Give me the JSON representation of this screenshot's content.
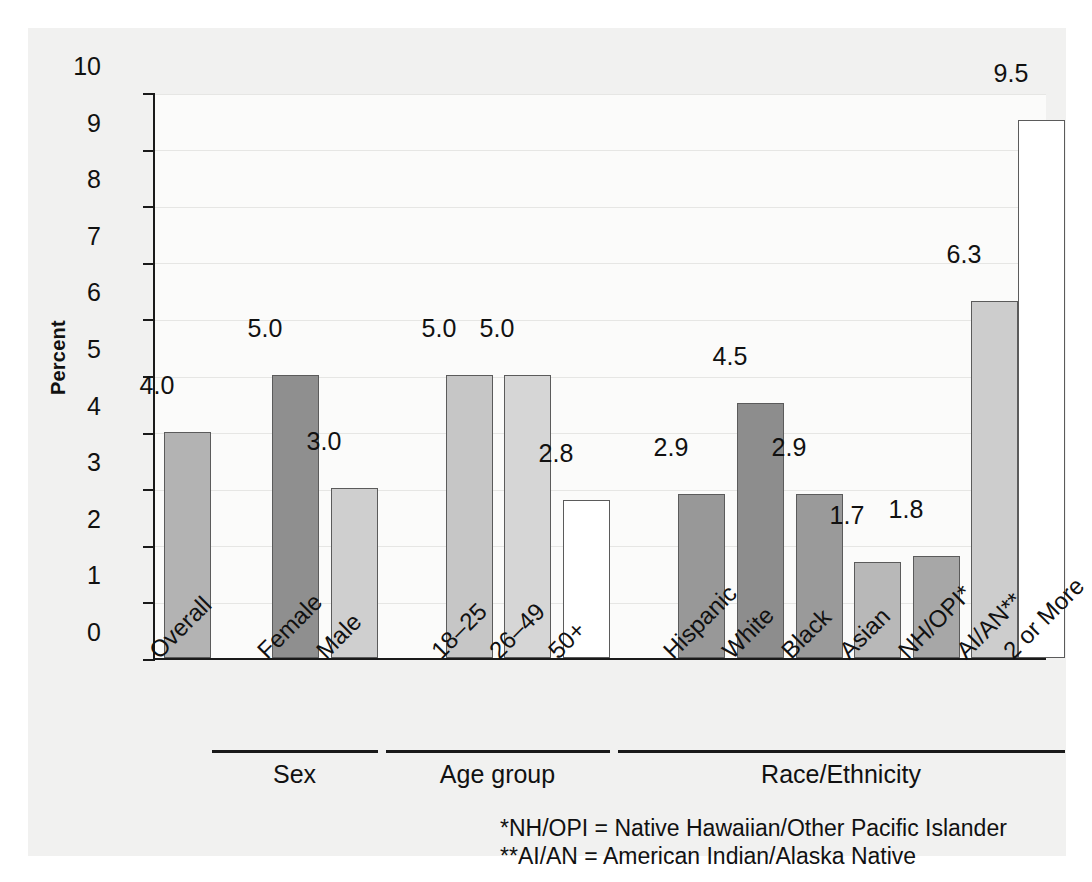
{
  "chart_data": {
    "type": "bar",
    "title": "",
    "xlabel": "",
    "ylabel": "Percent",
    "ylim": [
      0,
      10
    ],
    "yticks": [
      0,
      1,
      2,
      3,
      4,
      5,
      6,
      7,
      8,
      9,
      10
    ],
    "grid": true,
    "legend": "none",
    "categories": [
      "Overall",
      "Female",
      "Male",
      "18–25",
      "26–49",
      "50+",
      "Hispanic",
      "White",
      "Black",
      "Asian",
      "NH/OPI*",
      "AI/AN**",
      "2 or More"
    ],
    "values": [
      4.0,
      5.0,
      3.0,
      5.0,
      5.0,
      2.8,
      2.9,
      4.5,
      2.9,
      1.7,
      1.8,
      6.3,
      9.5
    ],
    "value_labels": [
      "4.0",
      "5.0",
      "3.0",
      "5.0",
      "5.0",
      "2.8",
      "2.9",
      "4.5",
      "2.9",
      "1.7",
      "1.8",
      "6.3",
      "9.5"
    ],
    "bar_colors": [
      "#b3b3b3",
      "#8f8f8f",
      "#cfcfcf",
      "#c6c6c6",
      "#d6d6d6",
      "#ffffff",
      "#989898",
      "#8d8d8d",
      "#9a9a9a",
      "#b8b8b8",
      "#a7a7a7",
      "#cdcdcd",
      "#ffffff"
    ],
    "bar_edge_color": "#5b5b5b",
    "groups": [
      {
        "label": "Sex",
        "start_index": 1,
        "end_index": 2
      },
      {
        "label": "Age group",
        "start_index": 3,
        "end_index": 5
      },
      {
        "label": "Race/Ethnicity",
        "start_index": 6,
        "end_index": 12
      }
    ],
    "annotations": [
      "*NH/OPI = Native Hawaiian/Other Pacific Islander",
      "**AI/AN = American Indian/Alaska Native"
    ]
  },
  "footnotes": {
    "line1": "*NH/OPI = Native Hawaiian/Other Pacific Islander",
    "line2": "**AI/AN = American Indian/Alaska Native"
  },
  "axis": {
    "y_title": "Percent"
  }
}
